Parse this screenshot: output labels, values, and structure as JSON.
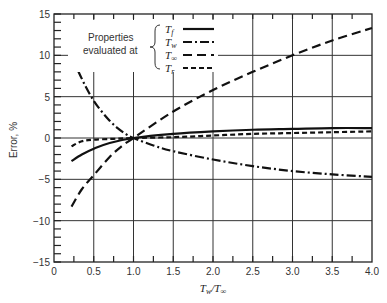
{
  "chart_data": {
    "type": "line",
    "title": "",
    "xlabel": "T_w/T_∞",
    "ylabel": "Error, %",
    "xlim": [
      0,
      4.0
    ],
    "ylim": [
      -15,
      15
    ],
    "grid": true,
    "x_ticks": [
      "0",
      "0.5",
      "1.0",
      "1.5",
      "2.0",
      "2.5",
      "3.0",
      "3.5",
      "4.0"
    ],
    "y_ticks": [
      "15",
      "10",
      "5",
      "0",
      "−5",
      "−10",
      "−15"
    ],
    "legend": {
      "heading": [
        "Properties",
        "evaluated at"
      ],
      "position": "upper-left",
      "entries": [
        "T_f",
        "T_w",
        "T_∞",
        "T_r"
      ]
    },
    "series": [
      {
        "name": "T_f",
        "style": "solid",
        "x": [
          0.22,
          0.35,
          0.5,
          0.7,
          1.0,
          1.5,
          2.0,
          2.5,
          3.0,
          3.5,
          4.0
        ],
        "values": [
          -2.8,
          -2.0,
          -1.3,
          -0.6,
          0.0,
          0.5,
          0.8,
          1.0,
          1.1,
          1.2,
          1.2
        ]
      },
      {
        "name": "T_w",
        "style": "dash-dot",
        "x": [
          0.22,
          0.3,
          0.4,
          0.5,
          0.6,
          0.7,
          0.8,
          0.9,
          1.0,
          1.25,
          1.5,
          2.0,
          2.5,
          3.0,
          3.5,
          4.0
        ],
        "values": [
          10.0,
          8.2,
          6.2,
          4.5,
          3.2,
          2.1,
          1.2,
          0.5,
          0.0,
          -0.9,
          -1.6,
          -2.6,
          -3.4,
          -4.0,
          -4.4,
          -4.7
        ]
      },
      {
        "name": "T_∞",
        "style": "long-dash",
        "x": [
          0.22,
          0.35,
          0.5,
          0.7,
          0.85,
          1.0,
          1.5,
          2.0,
          2.5,
          3.0,
          3.5,
          4.0
        ],
        "values": [
          -8.3,
          -6.2,
          -4.5,
          -2.3,
          -1.0,
          0.0,
          3.2,
          5.8,
          8.0,
          10.0,
          11.8,
          13.3
        ]
      },
      {
        "name": "T_r",
        "style": "short-dash",
        "x": [
          0.22,
          0.35,
          0.5,
          0.75,
          1.0,
          1.5,
          2.0,
          2.5,
          3.0,
          3.5,
          4.0
        ],
        "values": [
          -1.0,
          -0.4,
          -0.2,
          -0.1,
          0.0,
          0.1,
          0.3,
          0.5,
          0.6,
          0.7,
          0.8
        ]
      }
    ]
  },
  "labels": {
    "ylabel": "Error, %",
    "xlabel_num": "T",
    "xlabel_num_sub": "w",
    "xlabel_slash": "/T",
    "xlabel_den_sub": "∞",
    "legend_line1": "Properties",
    "legend_line2": "evaluated at",
    "legend": [
      {
        "base": "T",
        "sub": "f"
      },
      {
        "base": "T",
        "sub": "w"
      },
      {
        "base": "T",
        "sub": "∞"
      },
      {
        "base": "T",
        "sub": "r"
      }
    ]
  }
}
